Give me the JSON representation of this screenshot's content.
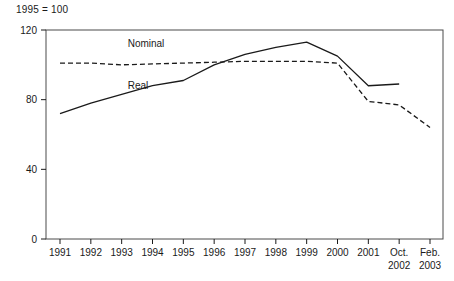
{
  "note": "1995 = 100",
  "chart_data": {
    "type": "line",
    "title": "",
    "subtitle": "",
    "note": "1995 = 100",
    "xlabel": "",
    "ylabel": "",
    "ylim": [
      0,
      120
    ],
    "yticks": [
      0,
      40,
      80,
      120
    ],
    "ytick_labels": [
      "0",
      "40",
      "80",
      "120"
    ],
    "grid": false,
    "legend_position": "inline-annotation",
    "categories": [
      "1991",
      "1992",
      "1993",
      "1994",
      "1995",
      "1996",
      "1997",
      "1998",
      "1999",
      "2000",
      "2001",
      "Oct. 2002",
      "Feb. 2003"
    ],
    "xtick_labels": [
      {
        "line1": "1991",
        "line2": ""
      },
      {
        "line1": "1992",
        "line2": ""
      },
      {
        "line1": "1993",
        "line2": ""
      },
      {
        "line1": "1994",
        "line2": ""
      },
      {
        "line1": "1995",
        "line2": ""
      },
      {
        "line1": "1996",
        "line2": ""
      },
      {
        "line1": "1997",
        "line2": ""
      },
      {
        "line1": "1998",
        "line2": ""
      },
      {
        "line1": "1999",
        "line2": ""
      },
      {
        "line1": "2000",
        "line2": ""
      },
      {
        "line1": "2001",
        "line2": ""
      },
      {
        "line1": "Oct.",
        "line2": "2002"
      },
      {
        "line1": "Feb.",
        "line2": "2003"
      }
    ],
    "series": [
      {
        "name": "Nominal",
        "style": "dashed",
        "color": "#1a1a1a",
        "label_x": "1993",
        "label_y": 110,
        "values": [
          101,
          101,
          100,
          100.5,
          101,
          101.5,
          102,
          102,
          102,
          101,
          79,
          77,
          64
        ]
      },
      {
        "name": "Real",
        "style": "solid",
        "color": "#1a1a1a",
        "label_x": "1993",
        "label_y": 86,
        "values": [
          72,
          78,
          83,
          88,
          91,
          100,
          106,
          110,
          113,
          105,
          88,
          89,
          null
        ]
      }
    ]
  }
}
